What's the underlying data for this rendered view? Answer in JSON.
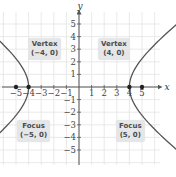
{
  "chart_data": {
    "type": "line",
    "title": "",
    "equation": "x^2/16 - y^2/9 = 1",
    "xlabel": "x",
    "ylabel": "y",
    "xlim": [
      -6,
      6
    ],
    "ylim": [
      -6,
      6
    ],
    "x_ticks": [
      -5,
      -4,
      -3,
      -2,
      -1,
      1,
      2,
      3,
      4,
      5
    ],
    "x_tick_labels": [
      "−5",
      "−4",
      "−3",
      "−2",
      "−1",
      "1",
      "2",
      "3",
      "4",
      "5"
    ],
    "y_ticks": [
      5,
      4,
      3,
      2,
      1,
      -1,
      -2,
      -3,
      -4,
      -5
    ],
    "y_tick_labels": [
      "5",
      "4",
      "3",
      "2",
      "1",
      "−1",
      "−2",
      "−3",
      "−4",
      "−5"
    ],
    "grid": true,
    "series": [
      {
        "name": "left-branch",
        "a": 4,
        "b": 3,
        "branch": "left"
      },
      {
        "name": "right-branch",
        "a": 4,
        "b": 3,
        "branch": "right"
      }
    ],
    "points": [
      {
        "name": "vertex-left",
        "x": -4,
        "y": 0
      },
      {
        "name": "vertex-right",
        "x": 4,
        "y": 0
      },
      {
        "name": "focus-left",
        "x": -5,
        "y": 0
      },
      {
        "name": "focus-right",
        "x": 5,
        "y": 0
      }
    ],
    "annotations": [
      {
        "title": "Vertex",
        "coords": "(−4, 0)"
      },
      {
        "title": "Vertex",
        "coords": "(4, 0)"
      },
      {
        "title": "Focus",
        "coords": "(−5, 0)"
      },
      {
        "title": "Focus",
        "coords": "(5, 0)"
      }
    ]
  },
  "colors": {
    "grid": "#e3e3e3",
    "axis": "#555555",
    "curve": "#555555",
    "point": "#222222",
    "callout_bg": "#e4e6e8",
    "callout_text": "#4a4a4a"
  }
}
